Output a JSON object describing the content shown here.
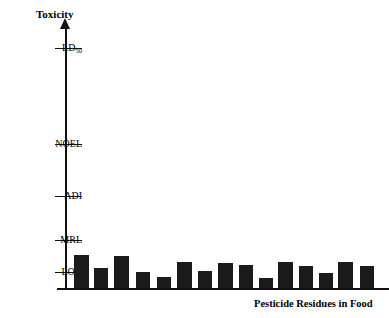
{
  "chart_data": {
    "type": "bar",
    "title": "",
    "ylabel": "Toxicity",
    "xlabel": "Pesticide Residues in Food",
    "grid": false,
    "legend": "none",
    "y_tick_labels": [
      "LD50",
      "NOEL",
      "ADI",
      "MRL",
      "LOD"
    ],
    "y_tick_label_display": [
      "LD",
      "NOEL",
      "ADI",
      "MRL",
      "LOD"
    ],
    "y_tick_subscripts": [
      "50",
      "",
      "",
      "",
      ""
    ],
    "y_tick_levels": [
      5,
      4,
      3,
      2,
      1
    ],
    "axis_note": "Ordinal toxicity scale: LOD (limit of detection) lowest, then MRL, ADI, NOEL, LD50 highest",
    "categories": [
      "1",
      "2",
      "3",
      "4",
      "5",
      "6",
      "7",
      "8",
      "9",
      "10",
      "11",
      "12",
      "13",
      "14",
      "15"
    ],
    "values": [
      1.55,
      1.12,
      1.5,
      0.92,
      0.74,
      1.32,
      0.95,
      1.28,
      1.2,
      0.62,
      1.3,
      1.15,
      0.85,
      1.32,
      1.18
    ],
    "value_units": "relative toxicity (LOD = 1.0, MRL = 2.0)",
    "ylim": [
      0,
      5.6
    ],
    "bar_color": "#1b1b1b",
    "bar_count": 15
  },
  "axes": {
    "y_title": "Toxicity",
    "x_title": "Pesticide Residues in Food"
  },
  "ticks": [
    {
      "label": "LD",
      "sub": "50",
      "y": 48
    },
    {
      "label": "NOEL",
      "sub": "",
      "y": 144
    },
    {
      "label": "ADI",
      "sub": "",
      "y": 196
    },
    {
      "label": "MRL",
      "sub": "",
      "y": 240
    },
    {
      "label": "LOD",
      "sub": "",
      "y": 272
    }
  ],
  "bars": [
    {
      "x": 74,
      "w": 15,
      "top": 255
    },
    {
      "x": 94,
      "w": 14,
      "top": 268
    },
    {
      "x": 114,
      "w": 15,
      "top": 256
    },
    {
      "x": 136,
      "w": 14,
      "top": 272
    },
    {
      "x": 157,
      "w": 14,
      "top": 277
    },
    {
      "x": 177,
      "w": 15,
      "top": 262
    },
    {
      "x": 198,
      "w": 14,
      "top": 271
    },
    {
      "x": 218,
      "w": 15,
      "top": 263
    },
    {
      "x": 239,
      "w": 14,
      "top": 265
    },
    {
      "x": 259,
      "w": 14,
      "top": 278
    },
    {
      "x": 278,
      "w": 15,
      "top": 262
    },
    {
      "x": 299,
      "w": 14,
      "top": 266
    },
    {
      "x": 319,
      "w": 14,
      "top": 273
    },
    {
      "x": 338,
      "w": 15,
      "top": 262
    },
    {
      "x": 360,
      "w": 14,
      "top": 266
    }
  ]
}
